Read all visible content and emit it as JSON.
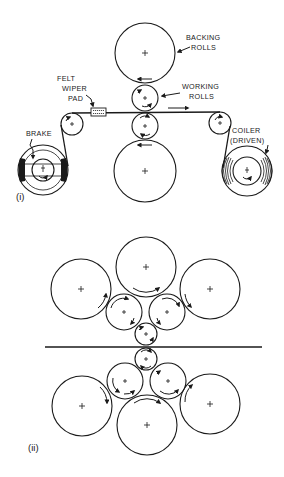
{
  "diagram": {
    "part_i": {
      "label": "(i)",
      "annotations": {
        "backing_rolls_line1": "BACKING",
        "backing_rolls_line2": "ROLLS",
        "working_rolls_line1": "WORKING",
        "working_rolls_line2": "ROLLS",
        "felt_line1": "FELT",
        "felt_line2": "WIPER",
        "felt_line3": "PAD",
        "brake": "BRAKE",
        "coiler_line1": "COILER",
        "coiler_line2": "(DRIVEN)"
      },
      "components": [
        {
          "name": "upper-backing-roll",
          "cx": 145,
          "cy": 53,
          "r": 30
        },
        {
          "name": "upper-working-roll",
          "cx": 145,
          "cy": 98,
          "r": 13
        },
        {
          "name": "lower-working-roll",
          "cx": 145,
          "cy": 126,
          "r": 13
        },
        {
          "name": "lower-backing-roll",
          "cx": 145,
          "cy": 171,
          "r": 31
        },
        {
          "name": "left-guide-roll",
          "cx": 72,
          "cy": 124,
          "r": 11
        },
        {
          "name": "right-guide-roll",
          "cx": 220,
          "cy": 123,
          "r": 11
        },
        {
          "name": "uncoiler-with-brake",
          "cx": 43,
          "cy": 170,
          "r": 25
        },
        {
          "name": "coiler-driven",
          "cx": 247,
          "cy": 171,
          "r": 25
        }
      ],
      "strip_direction": "left-to-right"
    },
    "part_ii": {
      "label": "(ii)",
      "arrangement": "cluster mill (1-2-3 roll cluster, upper and lower)",
      "components": [
        {
          "name": "upper-left-backing-roll",
          "cx": 81,
          "cy": 289,
          "r": 30
        },
        {
          "name": "upper-center-backing-roll",
          "cx": 146,
          "cy": 267,
          "r": 30
        },
        {
          "name": "upper-right-backing-roll",
          "cx": 210,
          "cy": 289,
          "r": 30
        },
        {
          "name": "upper-left-intermediate-roll",
          "cx": 124,
          "cy": 312,
          "r": 18
        },
        {
          "name": "upper-right-intermediate-roll",
          "cx": 167,
          "cy": 312,
          "r": 18
        },
        {
          "name": "upper-work-roll",
          "cx": 146,
          "cy": 334,
          "r": 11
        },
        {
          "name": "lower-work-roll",
          "cx": 146,
          "cy": 359,
          "r": 11
        },
        {
          "name": "lower-left-intermediate-roll",
          "cx": 125,
          "cy": 381,
          "r": 18
        },
        {
          "name": "lower-right-intermediate-roll",
          "cx": 168,
          "cy": 381,
          "r": 18
        },
        {
          "name": "lower-left-backing-roll",
          "cx": 82,
          "cy": 406,
          "r": 30
        },
        {
          "name": "lower-center-backing-roll",
          "cx": 147,
          "cy": 425,
          "r": 30
        },
        {
          "name": "lower-right-backing-roll",
          "cx": 210,
          "cy": 404,
          "r": 30
        }
      ]
    }
  }
}
